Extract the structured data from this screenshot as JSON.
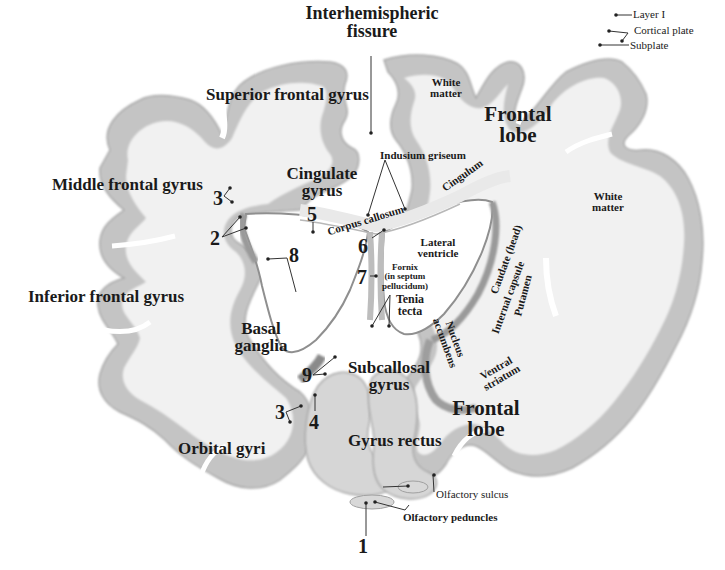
{
  "figure": {
    "colors": {
      "background": "#ffffff",
      "white_matter": "#f1f1f1",
      "cortex": "#bdbdbd",
      "cortex_dark": "#9a9a9a",
      "ventricle": "#ffffff",
      "label_text": "#1a1a1a",
      "leader_line": "#333333"
    }
  },
  "labels": {
    "interhemispheric_fissure": "Interhemispheric\nfissure",
    "superior_frontal_gyrus": "Superior frontal gyrus",
    "middle_frontal_gyrus": "Middle frontal gyrus",
    "inferior_frontal_gyrus": "Inferior frontal gyrus",
    "cingulate_gyrus": "Cingulate\ngyrus",
    "basal_ganglia": "Basal\nganglia",
    "subcallosal_gyrus": "Subcallosal\ngyrus",
    "orbital_gyri": "Orbital gyri",
    "gyrus_rectus": "Gyrus rectus",
    "frontal_lobe_top": "Frontal\nlobe",
    "frontal_lobe_bottom": "Frontal\nlobe",
    "white_matter_top": "White\nmatter",
    "white_matter_right": "White\nmatter",
    "layer_i": "Layer I",
    "cortical_plate": "Cortical plate",
    "subplate": "Subplate",
    "indusium_griseum": "Indusium griseum",
    "cingulum": "Cingulum",
    "corpus_callosum": "Corpus callosum",
    "lateral_ventricle": "Lateral\nventricle",
    "fornix": "Fornix\n(in septum\npellucidum)",
    "tenia_tecta": "Tenia\ntecta",
    "caudate_head": "Caudate (head)",
    "internal_capsule": "Internal capsule",
    "putamen": "Putamen",
    "nucleus_accumbens": "Nucleus\naccumbens",
    "ventral_striatum": "Ventral\nstriatum",
    "olfactory_sulcus": "Olfactory sulcus",
    "olfactory_peduncles": "Olfactory peduncles"
  },
  "numbers": {
    "n1": "1",
    "n2": "2",
    "n3_upper": "3",
    "n3_lower": "3",
    "n4": "4",
    "n5": "5",
    "n6": "6",
    "n7": "7",
    "n8": "8",
    "n9": "9"
  }
}
